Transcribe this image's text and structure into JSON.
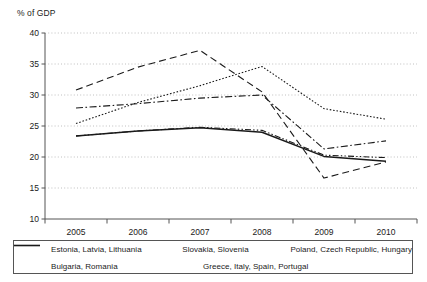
{
  "chart_data": {
    "type": "line",
    "title": "",
    "subtitle": "",
    "ylabel": "% of GDP",
    "xlabel": "",
    "x": [
      "2005",
      "2006",
      "2007",
      "2008",
      "2009",
      "2010"
    ],
    "categories": [
      "2005",
      "2006",
      "2007",
      "2008",
      "2009",
      "2010"
    ],
    "ylim": [
      10,
      40
    ],
    "yticks": [
      10,
      15,
      20,
      25,
      30,
      35,
      40
    ],
    "grid": "horizontal-dotted",
    "legend_position": "bottom",
    "series": [
      {
        "name": "Estonia, Latvia, Lithuania",
        "style": "dashed",
        "values": [
          30.8,
          34.5,
          37.2,
          30.5,
          16.6,
          19.2
        ]
      },
      {
        "name": "Slovakia, Slovenia",
        "style": "dash-dot",
        "values": [
          27.9,
          28.6,
          29.5,
          30.0,
          21.3,
          22.6
        ]
      },
      {
        "name": "Poland, Czech Republic, Hungary",
        "style": "dotted",
        "values": [
          25.4,
          28.8,
          31.5,
          34.6,
          27.8,
          26.1
        ]
      },
      {
        "name": "Bulgaria, Romania",
        "style": "dash-dot-dot",
        "values": [
          23.4,
          24.2,
          24.8,
          24.3,
          20.3,
          19.9
        ]
      },
      {
        "name": "Greece, Italy, Spain, Portugal",
        "style": "solid",
        "values": [
          23.4,
          24.2,
          24.7,
          24.0,
          20.1,
          19.3
        ]
      }
    ],
    "colors": {
      "line": "#1a1a1a",
      "grid": "#b0b0b0",
      "axis": "#555555",
      "background": "#ffffff"
    }
  },
  "legend": {
    "rows": [
      [
        {
          "label": "Estonia, Latvia, Lithuania",
          "style": "dashed"
        },
        {
          "label": "Slovakia, Slovenia",
          "style": "dash-dot"
        },
        {
          "label": "Poland, Czech Republic, Hungary",
          "style": "dotted"
        }
      ],
      [
        {
          "label": "Bulgaria, Romania",
          "style": "dash-dot-dot"
        },
        {
          "label": "Greece, Italy, Spain, Portugal",
          "style": "solid"
        }
      ]
    ]
  }
}
